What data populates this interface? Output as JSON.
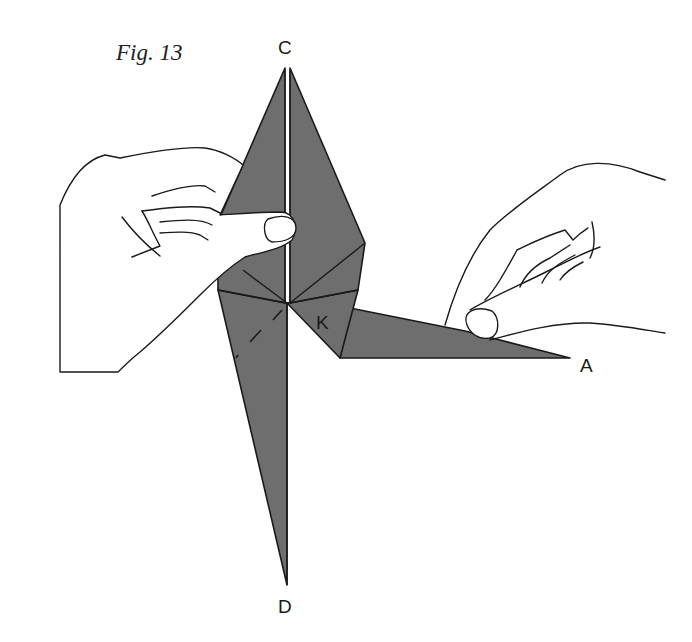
{
  "figure": {
    "title": "Fig. 13",
    "labels": {
      "top_point": "C",
      "bottom_point": "D",
      "right_point": "A",
      "flap": "K"
    },
    "colors": {
      "paper_fill": "#6e6e6e",
      "line": "#1a1a1a",
      "background": "#ffffff",
      "hand_fill": "#ffffff"
    }
  }
}
